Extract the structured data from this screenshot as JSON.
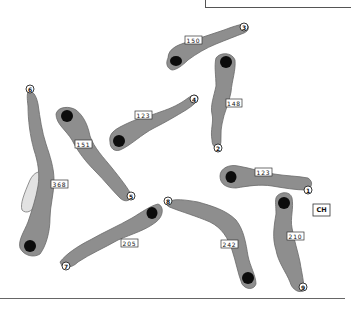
{
  "map": {
    "type": "golf-course-layout",
    "clubhouse_label": "CH",
    "colors": {
      "fairway": "#8e8e8e",
      "green": "#0c0c0c",
      "hazard": "#e2e2e2",
      "outline": "#333333"
    },
    "holes": [
      {
        "number": "1",
        "yardage": "123"
      },
      {
        "number": "2",
        "yardage": "148"
      },
      {
        "number": "3",
        "yardage": "150"
      },
      {
        "number": "4",
        "yardage": "123"
      },
      {
        "number": "5",
        "yardage": "151"
      },
      {
        "number": "6",
        "yardage": "368"
      },
      {
        "number": "7",
        "yardage": "205"
      },
      {
        "number": "8",
        "yardage": "242"
      },
      {
        "number": "9",
        "yardage": "210"
      }
    ]
  }
}
